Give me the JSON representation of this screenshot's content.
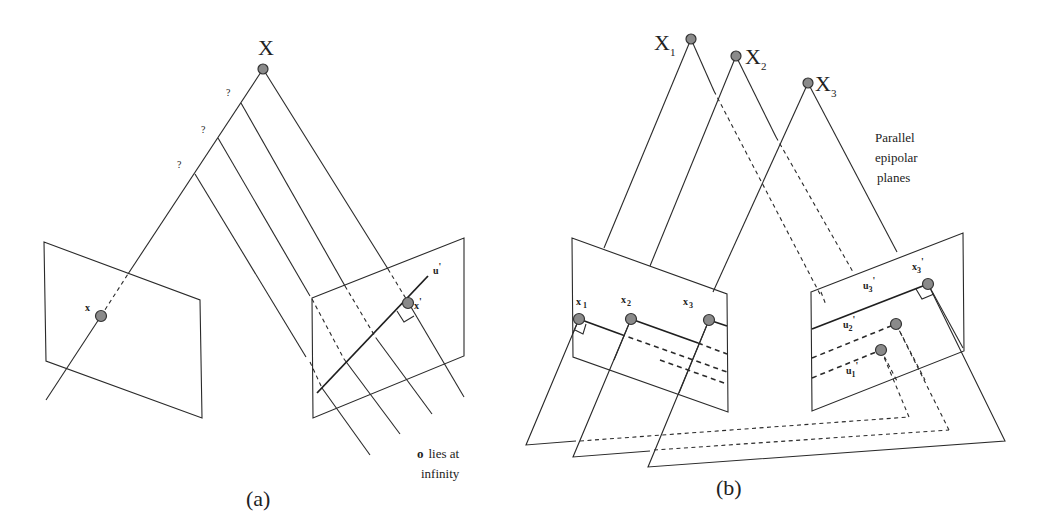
{
  "panel_a": {
    "caption": "(a)",
    "world_point_label": "X",
    "image_point_label": "x",
    "image_point_prime_label": "x",
    "prime_mark": "'",
    "epipolar_line_label": "u",
    "unknown_depth_marks": [
      "?",
      "?",
      "?"
    ],
    "note_bold": "o",
    "note_line1": "lies at",
    "note_line2": "infinity"
  },
  "panel_b": {
    "caption": "(b)",
    "world_points": [
      {
        "label": "X",
        "sub": "1"
      },
      {
        "label": "X",
        "sub": "2"
      },
      {
        "label": "X",
        "sub": "3"
      }
    ],
    "image_points": [
      {
        "label": "x",
        "sub": "1"
      },
      {
        "label": "x",
        "sub": "2"
      },
      {
        "label": "x",
        "sub": "3"
      }
    ],
    "prime_points": [
      {
        "label": "x",
        "sub": "3",
        "prime": "'"
      }
    ],
    "epipolar_lines": [
      {
        "label": "u",
        "sub": "3",
        "prime": "'"
      },
      {
        "label": "u",
        "sub": "2",
        "prime": "'"
      },
      {
        "label": "u",
        "sub": "1",
        "prime": "'"
      }
    ],
    "note_line1": "Parallel",
    "note_line2": "epipolar",
    "note_line3": "planes"
  },
  "colors": {
    "line": "#2a2a2a",
    "point_fill": "#8a8a8a",
    "background": "#ffffff"
  }
}
